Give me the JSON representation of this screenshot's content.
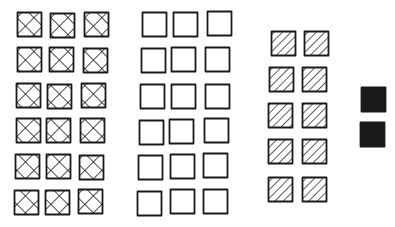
{
  "diagram": {
    "background": "#ffffff",
    "stroke_color": "#1a1a1a",
    "groups": [
      {
        "name": "crosshatched-group",
        "pattern": "crosshatch",
        "count": 18,
        "columns": 3,
        "rows": 6,
        "squares": [
          {
            "x": 17,
            "y": 12
          },
          {
            "x": 50,
            "y": 13
          },
          {
            "x": 84,
            "y": 12
          },
          {
            "x": 17,
            "y": 47
          },
          {
            "x": 49,
            "y": 47
          },
          {
            "x": 83,
            "y": 48
          },
          {
            "x": 16,
            "y": 83
          },
          {
            "x": 47,
            "y": 84
          },
          {
            "x": 81,
            "y": 83
          },
          {
            "x": 16,
            "y": 118
          },
          {
            "x": 46,
            "y": 118
          },
          {
            "x": 80,
            "y": 118
          },
          {
            "x": 15,
            "y": 154
          },
          {
            "x": 46,
            "y": 154
          },
          {
            "x": 79,
            "y": 155
          },
          {
            "x": 14,
            "y": 190
          },
          {
            "x": 45,
            "y": 190
          },
          {
            "x": 78,
            "y": 189
          }
        ]
      },
      {
        "name": "empty-group",
        "pattern": "empty",
        "count": 18,
        "columns": 3,
        "rows": 6,
        "squares": [
          {
            "x": 142,
            "y": 12
          },
          {
            "x": 173,
            "y": 12
          },
          {
            "x": 207,
            "y": 11
          },
          {
            "x": 141,
            "y": 48
          },
          {
            "x": 171,
            "y": 47
          },
          {
            "x": 205,
            "y": 47
          },
          {
            "x": 140,
            "y": 84
          },
          {
            "x": 171,
            "y": 84
          },
          {
            "x": 205,
            "y": 84
          },
          {
            "x": 139,
            "y": 120
          },
          {
            "x": 169,
            "y": 119
          },
          {
            "x": 204,
            "y": 118
          },
          {
            "x": 138,
            "y": 155
          },
          {
            "x": 170,
            "y": 154
          },
          {
            "x": 203,
            "y": 153
          },
          {
            "x": 137,
            "y": 191
          },
          {
            "x": 170,
            "y": 189
          },
          {
            "x": 203,
            "y": 189
          }
        ]
      },
      {
        "name": "hatched-group",
        "pattern": "diagonal-hatch",
        "count": 10,
        "columns": 2,
        "rows": 5,
        "squares": [
          {
            "x": 271,
            "y": 31
          },
          {
            "x": 304,
            "y": 31
          },
          {
            "x": 269,
            "y": 67
          },
          {
            "x": 302,
            "y": 67
          },
          {
            "x": 268,
            "y": 103
          },
          {
            "x": 302,
            "y": 103
          },
          {
            "x": 268,
            "y": 139
          },
          {
            "x": 302,
            "y": 139
          },
          {
            "x": 268,
            "y": 177
          },
          {
            "x": 302,
            "y": 177
          }
        ]
      },
      {
        "name": "solid-group",
        "pattern": "solid",
        "count": 2,
        "columns": 1,
        "rows": 2,
        "squares": [
          {
            "x": 361,
            "y": 87
          },
          {
            "x": 360,
            "y": 122
          }
        ]
      }
    ],
    "square_size": 24
  }
}
